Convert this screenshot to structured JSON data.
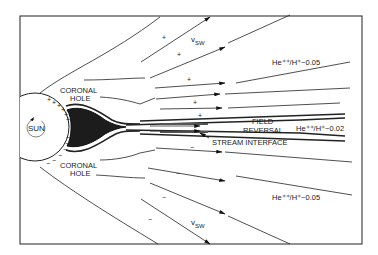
{
  "diagram": {
    "labels": {
      "sun": "SUN",
      "coronal_hole_top_1": "CORONAL",
      "coronal_hole_top_2": "HOLE",
      "coronal_hole_bottom_1": "CORONAL",
      "coronal_hole_bottom_2": "HOLE",
      "vsw_top": "v",
      "vsw_top_sub": "SW",
      "vsw_bottom": "v",
      "vsw_bottom_sub": "SW",
      "ratio_top": "He⁺⁺/H⁺~0.05",
      "ratio_mid": "He⁺⁺/H⁺~0.02",
      "ratio_bottom": "He⁺⁺/H⁺~0.05",
      "field_1": "FIELD",
      "field_2": "REVERSAL",
      "stream_interface": "STREAM INTERFACE"
    },
    "polarity": {
      "positive": "+",
      "negative": "−"
    },
    "colors": {
      "line": "#222222",
      "background": "#ffffff",
      "streamer": "#1c1c1c"
    }
  }
}
